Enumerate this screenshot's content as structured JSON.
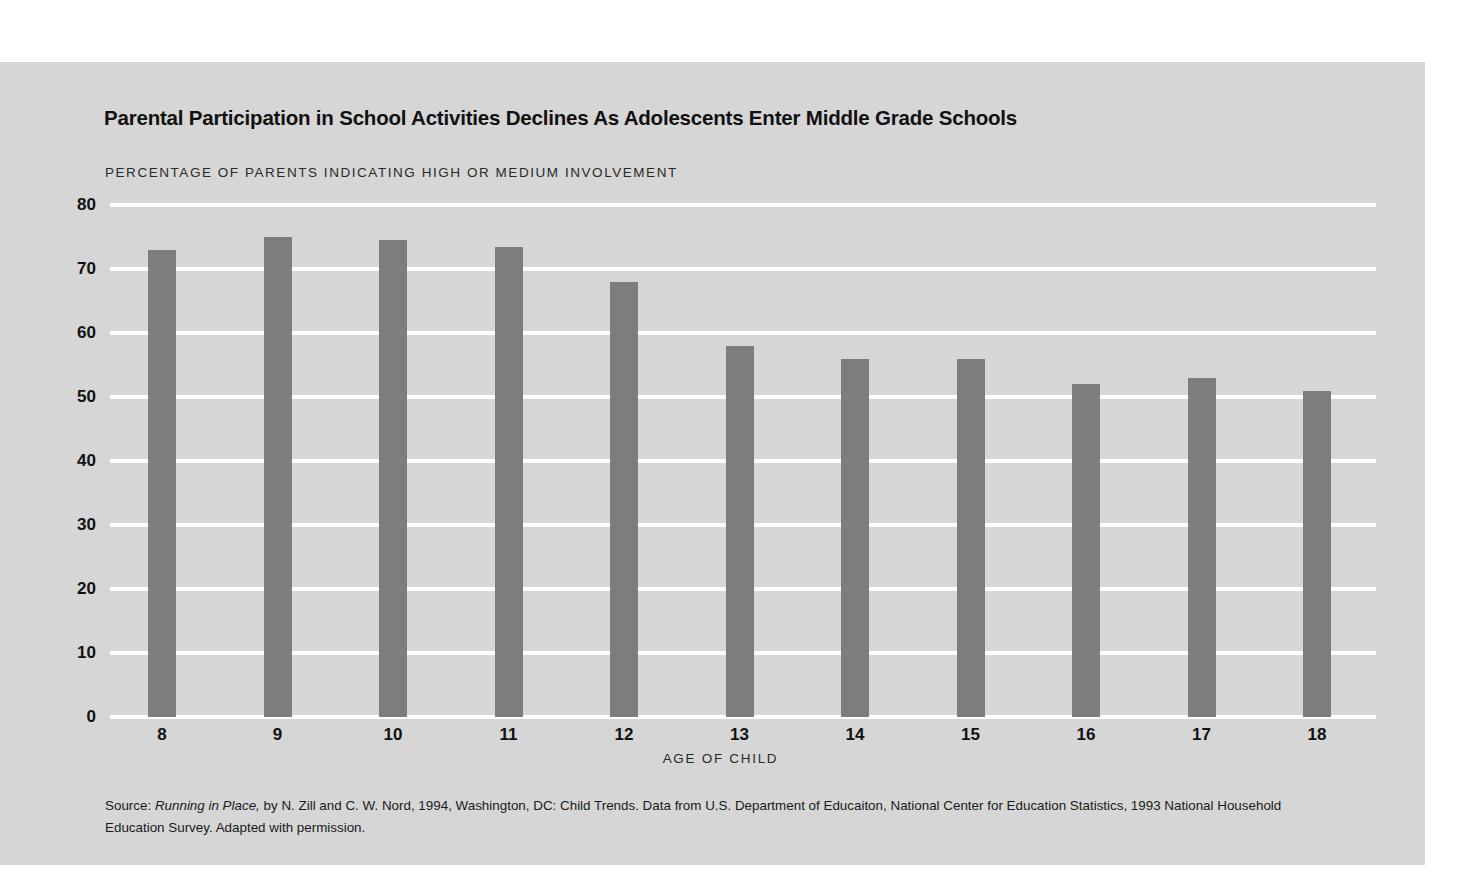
{
  "figure": {
    "title": "Parental Participation in School Activities Declines As Adolescents Enter Middle Grade Schools",
    "subtitle": "PERCENTAGE OF PARENTS INDICATING HIGH OR MEDIUM INVOLVEMENT",
    "xaxis_label": "AGE OF CHILD",
    "source": {
      "prefix": "Source: ",
      "italic_title": "Running in Place,",
      "rest": " by N. Zill and C. W. Nord, 1994, Washington, DC: Child Trends. Data from U.S. Department of Educaiton, National Center for Education Statistics, 1993 National Household Education Survey. Adapted with permission."
    },
    "colors": {
      "panel_background": "#d6d6d6",
      "bar_fill": "#7d7d7d",
      "gridline": "#ffffff",
      "text": "#111111",
      "page_background": "#ffffff"
    }
  },
  "chart_data": {
    "type": "bar",
    "title": "Parental Participation in School Activities Declines As Adolescents Enter Middle Grade Schools",
    "subtitle": "PERCENTAGE OF PARENTS INDICATING HIGH OR MEDIUM INVOLVEMENT",
    "xlabel": "AGE OF CHILD",
    "ylabel": "PERCENTAGE OF PARENTS INDICATING HIGH OR MEDIUM INVOLVEMENT",
    "categories": [
      "8",
      "9",
      "10",
      "11",
      "12",
      "13",
      "14",
      "15",
      "16",
      "17",
      "18"
    ],
    "values": [
      73,
      75,
      74.5,
      73.5,
      68,
      58,
      56,
      56,
      52,
      53,
      51
    ],
    "ylim": [
      0,
      80
    ],
    "yticks": [
      "0",
      "10",
      "20",
      "30",
      "40",
      "50",
      "60",
      "70",
      "80"
    ],
    "ytick_values": [
      0,
      10,
      20,
      30,
      40,
      50,
      60,
      70,
      80
    ],
    "grid": true,
    "legend": false,
    "legend_position": "none"
  }
}
